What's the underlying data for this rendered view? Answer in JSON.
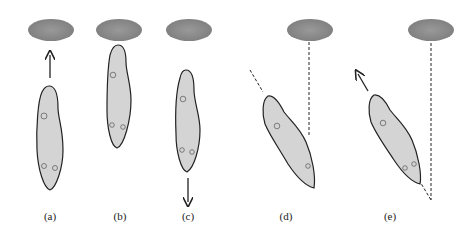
{
  "figure": {
    "panels": [
      {
        "id": "a",
        "label": "(a)",
        "description": "Organism below object, arrow pointing up toward it"
      },
      {
        "id": "b",
        "label": "(b)",
        "description": "Organism touching object from below"
      },
      {
        "id": "c",
        "label": "(c)",
        "description": "Organism moving away, arrow pointing down"
      },
      {
        "id": "d",
        "label": "(d)",
        "description": "Organism rotated, dashed line from object and dashed axis line"
      },
      {
        "id": "e",
        "label": "(e)",
        "description": "Organism rotated moving off at angle, arrow up-left, dashed lines converge"
      }
    ],
    "colors": {
      "object": "#8a8a8a",
      "body_fill": "#d4d4d4",
      "outline": "#222222"
    }
  }
}
